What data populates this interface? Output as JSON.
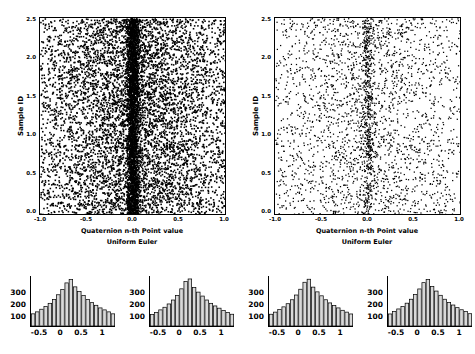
{
  "chart_data": [
    {
      "type": "scatter",
      "id": "left-scatter",
      "title": "",
      "xlabel": "Quaternion n-th Point value",
      "xlabel2": "Uniform Euler",
      "ylabel": "Sample ID",
      "xlim": [
        -1.0,
        1.0
      ],
      "ylim": [
        0.0,
        2.5
      ],
      "xticks": [
        -1.0,
        -0.5,
        0.0,
        0.5,
        1.0
      ],
      "xticklabels": [
        "-1.0",
        "-0.5",
        "0.0",
        "0.5",
        "1.0"
      ],
      "yticks": [
        0.0,
        0.5,
        1.0,
        1.5,
        2.0,
        2.5
      ],
      "yticklabels": [
        "0.0",
        "0.5",
        "1.0",
        "1.5",
        "2.0",
        "2.5"
      ],
      "grid": false,
      "marker_color": "#000000",
      "point_count": 9000,
      "density_note": "dense dark cloud, sharp concentration spike at x=0",
      "distribution": {
        "center": 0.0,
        "spike_fraction": 0.3,
        "spike_width": 0.035,
        "broad_sigma": 0.52
      }
    },
    {
      "type": "scatter",
      "id": "right-scatter",
      "title": "",
      "xlabel": "Quaternion n-th Point value",
      "xlabel2": "Uniform Euler",
      "ylabel": "Sample ID",
      "xlim": [
        -1.0,
        1.0
      ],
      "ylim": [
        0.0,
        2.5
      ],
      "xticks": [
        -1.0,
        -0.5,
        0.0,
        0.5,
        1.0
      ],
      "xticklabels": [
        "-1.0",
        "-0.5",
        "0.0",
        "0.5",
        "1.0"
      ],
      "yticks": [
        0.0,
        0.5,
        1.0,
        1.5,
        2.0,
        2.5
      ],
      "yticklabels": [
        "0.0",
        "0.5",
        "1.0",
        "1.5",
        "2.0",
        "2.5"
      ],
      "grid": false,
      "marker_color": "#000000",
      "point_count": 3000,
      "density_note": "sparser cloud, faint concentration line at x=0",
      "distribution": {
        "center": 0.0,
        "spike_fraction": 0.16,
        "spike_width": 0.03,
        "broad_sigma": 0.55
      }
    },
    {
      "type": "bar",
      "id": "hist-1",
      "title": "",
      "xlabel": "",
      "ylabel": "",
      "xlim": [
        -1.0,
        1.0
      ],
      "ylim": [
        0,
        380
      ],
      "yticks": [
        100,
        200,
        300
      ],
      "yticklabels": [
        "100",
        "200",
        "300"
      ],
      "xticks": [
        -0.5,
        0,
        0.5,
        1
      ],
      "xticklabels": [
        "-0.5",
        "0",
        "0.5",
        "1"
      ],
      "bar_color": "#d9d9d9",
      "bar_edge_color": "#000000",
      "categories": [
        "-1.00",
        "-0.90",
        "-0.80",
        "-0.70",
        "-0.60",
        "-0.50",
        "-0.40",
        "-0.30",
        "-0.20",
        "-0.10",
        "0.00",
        "0.10",
        "0.20",
        "0.30",
        "0.40",
        "0.50",
        "0.60",
        "0.70",
        "0.80",
        "0.90"
      ],
      "values": [
        95,
        110,
        130,
        150,
        175,
        205,
        240,
        280,
        330,
        355,
        300,
        265,
        235,
        205,
        180,
        160,
        140,
        125,
        110,
        95
      ]
    },
    {
      "type": "bar",
      "id": "hist-2",
      "title": "",
      "xlabel": "",
      "ylabel": "",
      "xlim": [
        -1.0,
        1.0
      ],
      "ylim": [
        0,
        380
      ],
      "yticks": [
        100,
        200,
        300
      ],
      "yticklabels": [
        "100",
        "200",
        "300"
      ],
      "xticks": [
        -0.5,
        0,
        0.5,
        1
      ],
      "xticklabels": [
        "-0.5",
        "0",
        "0.5",
        "1"
      ],
      "bar_color": "#d9d9d9",
      "bar_edge_color": "#000000",
      "categories": [
        "-1.00",
        "-0.90",
        "-0.80",
        "-0.70",
        "-0.60",
        "-0.50",
        "-0.40",
        "-0.30",
        "-0.20",
        "-0.10",
        "0.00",
        "0.10",
        "0.20",
        "0.30",
        "0.40",
        "0.50",
        "0.60",
        "0.70",
        "0.80",
        "0.90"
      ],
      "values": [
        90,
        105,
        125,
        145,
        170,
        200,
        235,
        285,
        340,
        360,
        295,
        260,
        230,
        200,
        175,
        155,
        138,
        120,
        105,
        92
      ]
    },
    {
      "type": "bar",
      "id": "hist-3",
      "title": "",
      "xlabel": "",
      "ylabel": "",
      "xlim": [
        -1.0,
        1.0
      ],
      "ylim": [
        0,
        380
      ],
      "yticks": [
        100,
        200,
        300
      ],
      "yticklabels": [
        "100",
        "200",
        "300"
      ],
      "xticks": [
        -0.5,
        0,
        0.5,
        1
      ],
      "xticklabels": [
        "-0.5",
        "0",
        "0.5",
        "1"
      ],
      "bar_color": "#d9d9d9",
      "bar_edge_color": "#000000",
      "categories": [
        "-1.00",
        "-0.90",
        "-0.80",
        "-0.70",
        "-0.60",
        "-0.50",
        "-0.40",
        "-0.30",
        "-0.20",
        "-0.10",
        "0.00",
        "0.10",
        "0.20",
        "0.30",
        "0.40",
        "0.50",
        "0.60",
        "0.70",
        "0.80",
        "0.90"
      ],
      "values": [
        92,
        108,
        128,
        148,
        172,
        202,
        238,
        282,
        335,
        358,
        298,
        262,
        232,
        202,
        178,
        158,
        140,
        122,
        108,
        94
      ]
    },
    {
      "type": "bar",
      "id": "hist-4",
      "title": "",
      "xlabel": "",
      "ylabel": "",
      "xlim": [
        -1.0,
        1.0
      ],
      "ylim": [
        0,
        380
      ],
      "yticks": [
        100,
        200,
        300
      ],
      "yticklabels": [
        "100",
        "200",
        "300"
      ],
      "xticks": [
        -0.5,
        0,
        0.5,
        1
      ],
      "xticklabels": [
        "-0.5",
        "0",
        "0.5",
        "1"
      ],
      "bar_color": "#d9d9d9",
      "bar_edge_color": "#000000",
      "categories": [
        "-1.00",
        "-0.90",
        "-0.80",
        "-0.70",
        "-0.60",
        "-0.50",
        "-0.40",
        "-0.30",
        "-0.20",
        "-0.10",
        "0.00",
        "0.10",
        "0.20",
        "0.30",
        "0.40",
        "0.50",
        "0.60",
        "0.70",
        "0.80",
        "0.90"
      ],
      "values": [
        94,
        112,
        132,
        152,
        176,
        206,
        242,
        284,
        332,
        356,
        302,
        268,
        236,
        206,
        182,
        162,
        142,
        126,
        112,
        96
      ]
    }
  ],
  "figure": {
    "background": "#ffffff",
    "axis_color": "#000000"
  }
}
